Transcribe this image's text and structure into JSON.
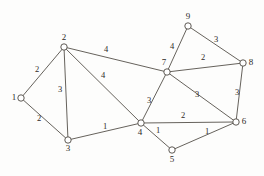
{
  "figure": {
    "background_color": "#fdfdfc",
    "node_fill_color": "#ffffff",
    "node_stroke_color": "#4c4741",
    "edge_color": "#555049",
    "label_color": "#2e2a26"
  },
  "chart_data": {
    "type": "diagram",
    "title": "",
    "subtitle": "",
    "xlabel": "",
    "ylabel": "",
    "graph_kind": "undirected weighted graph",
    "node_count": 9,
    "edge_count": 14,
    "nodes": [
      {
        "id": "1",
        "label": "1",
        "x": 21,
        "y": 98,
        "label_dx": -7,
        "label_dy": 0
      },
      {
        "id": "2",
        "label": "2",
        "x": 64,
        "y": 47,
        "label_dx": 0,
        "label_dy": -9
      },
      {
        "id": "3",
        "label": "3",
        "x": 68,
        "y": 140,
        "label_dx": 0,
        "label_dy": 9
      },
      {
        "id": "4",
        "label": "4",
        "x": 141,
        "y": 123,
        "label_dx": -1,
        "label_dy": 10
      },
      {
        "id": "5",
        "label": "5",
        "x": 172,
        "y": 150,
        "label_dx": 0,
        "label_dy": 10
      },
      {
        "id": "6",
        "label": "6",
        "x": 236,
        "y": 122,
        "label_dx": 8,
        "label_dy": 0
      },
      {
        "id": "7",
        "label": "7",
        "x": 167,
        "y": 72,
        "label_dx": -3,
        "label_dy": -9
      },
      {
        "id": "8",
        "label": "8",
        "x": 243,
        "y": 63,
        "label_dx": 8,
        "label_dy": 0
      },
      {
        "id": "9",
        "label": "9",
        "x": 188,
        "y": 26,
        "label_dx": 0,
        "label_dy": -9
      }
    ],
    "edges": [
      {
        "source": "1",
        "target": "2",
        "weight": "2",
        "label_x": 37,
        "label_y": 70
      },
      {
        "source": "1",
        "target": "3",
        "weight": "2",
        "label_x": 39,
        "label_y": 119
      },
      {
        "source": "2",
        "target": "3",
        "weight": "3",
        "label_x": 60,
        "label_y": 90
      },
      {
        "source": "2",
        "target": "4",
        "weight": "4",
        "label_x": 103,
        "label_y": 76
      },
      {
        "source": "2",
        "target": "7",
        "weight": "4",
        "label_x": 106,
        "label_y": 50
      },
      {
        "source": "3",
        "target": "4",
        "weight": "1",
        "label_x": 105,
        "label_y": 127
      },
      {
        "source": "4",
        "target": "5",
        "weight": "1",
        "label_x": 158,
        "label_y": 131
      },
      {
        "source": "4",
        "target": "6",
        "weight": "2",
        "label_x": 183,
        "label_y": 116
      },
      {
        "source": "4",
        "target": "7",
        "weight": "3",
        "label_x": 149,
        "label_y": 101
      },
      {
        "source": "5",
        "target": "6",
        "weight": "1",
        "label_x": 207,
        "label_y": 132
      },
      {
        "source": "6",
        "target": "7",
        "weight": "3",
        "label_x": 197,
        "label_y": 95
      },
      {
        "source": "6",
        "target": "8",
        "weight": "3",
        "label_x": 237,
        "label_y": 93
      },
      {
        "source": "7",
        "target": "8",
        "weight": "2",
        "label_x": 203,
        "label_y": 58
      },
      {
        "source": "7",
        "target": "9",
        "weight": "4",
        "label_x": 172,
        "label_y": 47
      },
      {
        "source": "8",
        "target": "9",
        "weight": "3",
        "label_x": 216,
        "label_y": 40
      }
    ],
    "node_radius": 3.2,
    "legend": [],
    "annotations": []
  }
}
